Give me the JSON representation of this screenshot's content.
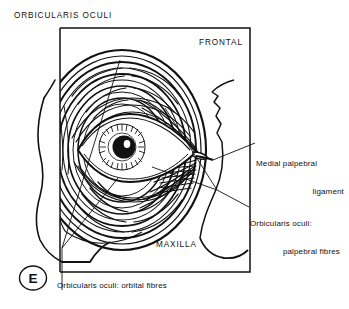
{
  "figure": {
    "panel_letter": "E",
    "background_color": "#ffffff",
    "ink_color": "#111111"
  },
  "labels": {
    "title": "ORBICULARIS OCULI",
    "frontal": "FRONTAL",
    "maxilla": "MAXILLA",
    "medial_palpebral_ligament_line1": "Medial palpebral",
    "medial_palpebral_ligament_line2": "ligament",
    "palpebral_fibres_line1": "Orbicularis oculi:",
    "palpebral_fibres_line2": "palpebral fibres",
    "orbital_fibres": "Orbicularis oculi: orbital fibres"
  }
}
